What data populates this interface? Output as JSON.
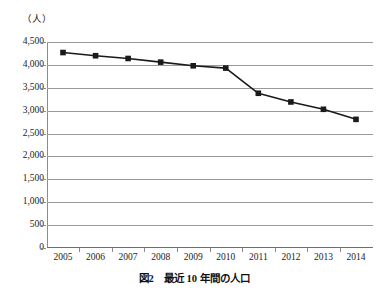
{
  "chart_data": {
    "type": "line",
    "title": "",
    "caption": "図2　最近 10 年間の人口",
    "xlabel": "",
    "ylabel": "（人）",
    "categories": [
      "2005",
      "2006",
      "2007",
      "2008",
      "2009",
      "2010",
      "2011",
      "2012",
      "2013",
      "2014"
    ],
    "values": [
      4270,
      4200,
      4140,
      4060,
      3980,
      3930,
      3380,
      3190,
      3030,
      2810
    ],
    "ylim": [
      0,
      4500
    ],
    "ytick_labels": [
      "4,500",
      "4,000",
      "3,500",
      "3,000",
      "2,500",
      "2,000",
      "1,500",
      "1,000",
      "500",
      "0"
    ],
    "ytick_values": [
      4500,
      4000,
      3500,
      3000,
      2500,
      2000,
      1500,
      1000,
      500,
      0
    ],
    "grid": true,
    "legend": "none",
    "series": [
      {
        "name": "人口",
        "values": [
          4270,
          4200,
          4140,
          4060,
          3980,
          3930,
          3380,
          3190,
          3030,
          2810
        ],
        "line_color": "#1a1a1a",
        "marker": "square",
        "marker_color": "#1a1a1a"
      }
    ],
    "colors": {
      "line": "#1a1a1a",
      "marker": "#1a1a1a",
      "grid": "#9a9a9a",
      "axis": "#6e6e6e",
      "text": "#222222",
      "background": "#ffffff"
    }
  }
}
